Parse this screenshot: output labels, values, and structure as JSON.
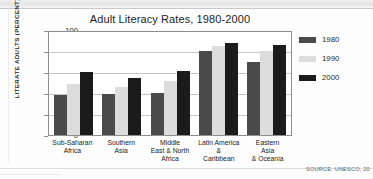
{
  "chart_data": {
    "type": "bar",
    "title": "Adult Literacy Rates, 1980-2000",
    "xlabel": "",
    "ylabel": "LITERATE ADULTS (PERCENT)",
    "ylim": [
      0,
      100
    ],
    "ytick_values": [
      100,
      80,
      60,
      40,
      20,
      0
    ],
    "ytick_labels": [
      "100",
      "80",
      "60",
      "40",
      "20",
      "0"
    ],
    "grid": true,
    "legend_position": "right",
    "categories": [
      "Sub-Saharan Africa",
      "Southern Asia",
      "Middle East & North Africa",
      "Latin America & Caribbean",
      "Eastern Asia & Oceania"
    ],
    "category_label_lines": [
      [
        "Sub-Saharan",
        "Africa"
      ],
      [
        "Southern",
        "Asia"
      ],
      [
        "Middle",
        "East & North",
        "Africa"
      ],
      [
        "Latin America",
        "&",
        "Caribbean"
      ],
      [
        "Eastern",
        "Asia",
        "& Oceania"
      ]
    ],
    "series": [
      {
        "name": "1980",
        "color": "#4a4a4a",
        "values": [
          38,
          39,
          40,
          80,
          70
        ]
      },
      {
        "name": "1990",
        "color": "#dcdcdc",
        "values": [
          49,
          46,
          51,
          85,
          80
        ]
      },
      {
        "name": "2000",
        "color": "#1b1b1b",
        "values": [
          60,
          54,
          61,
          88,
          86
        ]
      }
    ],
    "source_note": "SOURCE: UNESCO, 20"
  }
}
